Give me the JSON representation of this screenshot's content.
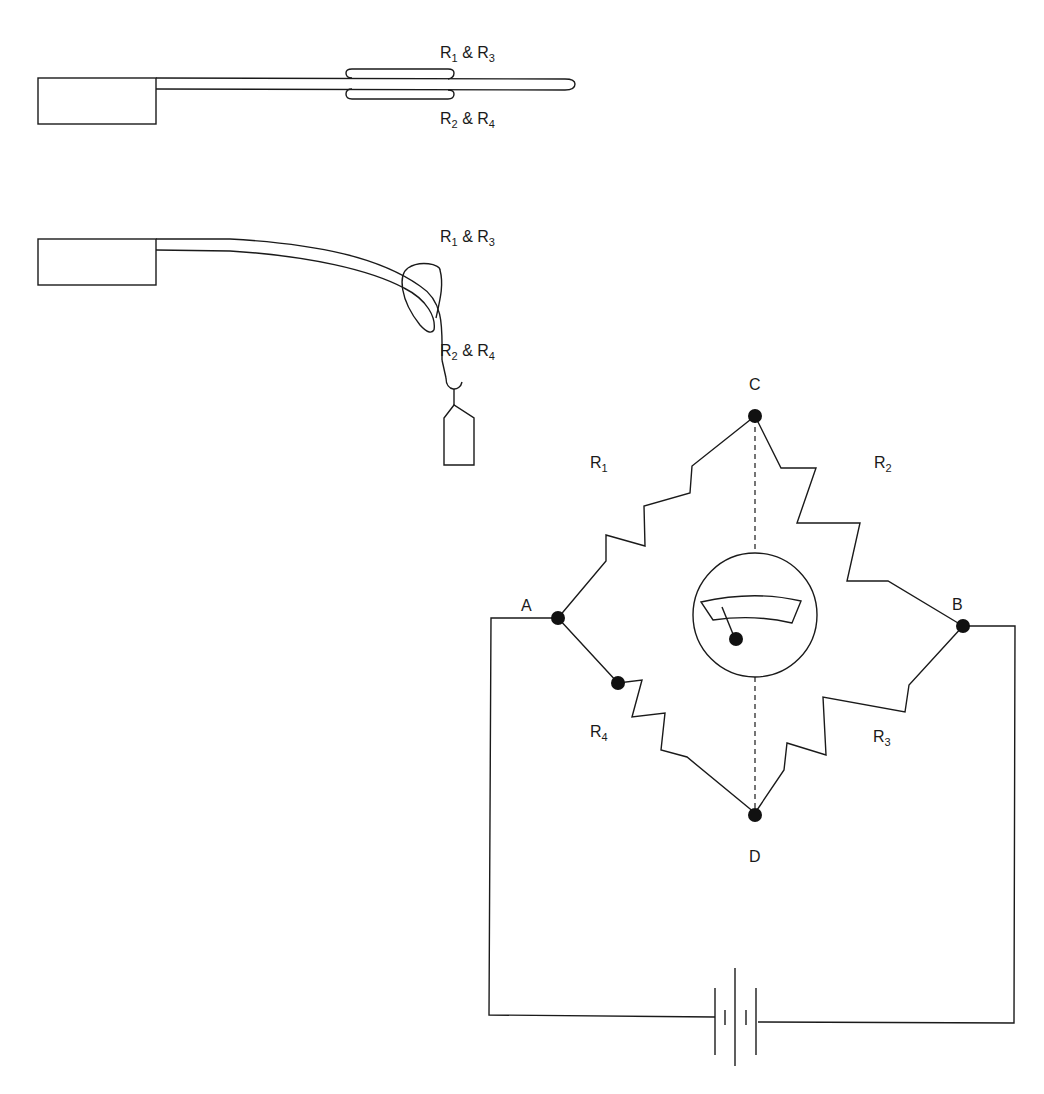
{
  "diagram": {
    "type": "strain-gauge-wheatstone-bridge",
    "colors": {
      "line": "#1a1a1a",
      "background": "#ffffff",
      "node": "#111111"
    },
    "beam_unloaded": {
      "top_label": {
        "main1": "R",
        "sub1": "1",
        "amp": " & ",
        "main2": "R",
        "sub2": "3"
      },
      "bottom_label": {
        "main1": "R",
        "sub1": "2",
        "amp": " & ",
        "main2": "R",
        "sub2": "4"
      }
    },
    "beam_loaded": {
      "top_label": {
        "main1": "R",
        "sub1": "1",
        "amp": " & ",
        "main2": "R",
        "sub2": "3"
      },
      "bottom_label": {
        "main1": "R",
        "sub1": "2",
        "amp": " & ",
        "main2": "R",
        "sub2": "4"
      }
    },
    "bridge": {
      "nodes": {
        "a": "A",
        "b": "B",
        "c": "C",
        "d": "D"
      },
      "resistors": {
        "r1": {
          "main": "R",
          "sub": "1"
        },
        "r2": {
          "main": "R",
          "sub": "2"
        },
        "r3": {
          "main": "R",
          "sub": "3"
        },
        "r4": {
          "main": "R",
          "sub": "4"
        }
      },
      "meter": "galvanometer-icon",
      "source": "battery-icon"
    }
  }
}
